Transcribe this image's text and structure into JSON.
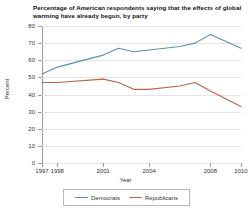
{
  "chart_data": {
    "type": "line",
    "title": "Percentage of American respondents saying that the effects of global warming have already begun, by party",
    "xlabel": "Year",
    "ylabel": "Percent",
    "ylim": [
      0,
      80
    ],
    "xlim": [
      1997,
      2010
    ],
    "grid": true,
    "legend_position": "bottom",
    "ytick_labels": [
      "0",
      "10",
      "20",
      "30",
      "40",
      "50",
      "60",
      "70",
      "80"
    ],
    "ytick_values": [
      0,
      10,
      20,
      30,
      40,
      50,
      60,
      70,
      80
    ],
    "xtick_labels": [
      "1997",
      "1998",
      "2001",
      "2004",
      "2008",
      "2010"
    ],
    "xtick_values": [
      1997,
      1998,
      2001,
      2004,
      2008,
      2010
    ],
    "series": [
      {
        "name": "Democrats",
        "color": "#5b8db8",
        "x": [
          1997,
          1998,
          2001,
          2002,
          2003,
          2004,
          2006,
          2007,
          2008,
          2010
        ],
        "values": [
          52,
          56,
          63,
          67,
          65,
          66,
          68,
          70,
          75,
          67
        ]
      },
      {
        "name": "Republicans",
        "color": "#c0604c",
        "x": [
          1997,
          1998,
          2001,
          2002,
          2003,
          2004,
          2006,
          2007,
          2008,
          2010
        ],
        "values": [
          47,
          47,
          49,
          47,
          43,
          43,
          45,
          47,
          42,
          33
        ]
      }
    ]
  },
  "legend": {
    "entries": [
      {
        "label": "Democrats",
        "color": "#5b8db8"
      },
      {
        "label": "Republicans",
        "color": "#c0604c"
      }
    ]
  },
  "colors": {
    "democrat_blue": "#5b8db8",
    "republican_red": "#c0604c",
    "gridline": "#e3e3e3",
    "axis": "#9a9a9a",
    "text": "#333333",
    "background": "#ffffff"
  }
}
